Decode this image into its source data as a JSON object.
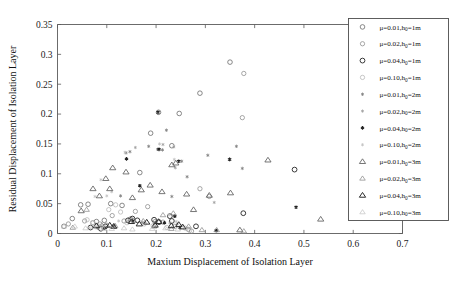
{
  "chart_data": {
    "type": "scatter",
    "title": "",
    "xlabel": "Maxium Displacement of Isolation Layer",
    "ylabel": "Residual Displacement of Isolation Layer",
    "xlim": [
      0,
      0.7
    ],
    "ylim": [
      0,
      0.35
    ],
    "xticks": [
      "0",
      "0.1",
      "0.2",
      "0.3",
      "0.4",
      "0.5",
      "0.6",
      "0.7"
    ],
    "xtick_values": [
      0,
      0.1,
      0.2,
      0.3,
      0.4,
      0.5,
      0.6,
      0.7
    ],
    "yticks": [
      "0",
      "0.05",
      "0.1",
      "0.15",
      "0.2",
      "0.25",
      "0.3",
      "0.35"
    ],
    "ytick_values": [
      0,
      0.05,
      0.1,
      0.15,
      0.2,
      0.25,
      0.3,
      0.35
    ],
    "grid": false,
    "legend_position": "right",
    "series": [
      {
        "name": "mu=0.01,h0=1m",
        "label_mu": "μ=0.01,h",
        "label_sub": "0",
        "label_tail": "=1m",
        "marker": "circle",
        "color": "#6b6b6b",
        "size": 4.6,
        "stroke_width": 0.8,
        "points": [
          [
            0.013,
            0.012
          ],
          [
            0.03,
            0.025
          ],
          [
            0.047,
            0.048
          ],
          [
            0.062,
            0.049
          ],
          [
            0.079,
            0.02
          ],
          [
            0.095,
            0.022
          ],
          [
            0.108,
            0.05
          ],
          [
            0.131,
            0.047
          ],
          [
            0.148,
            0.024
          ],
          [
            0.167,
            0.102
          ],
          [
            0.189,
            0.168
          ],
          [
            0.205,
            0.203
          ],
          [
            0.232,
            0.147
          ],
          [
            0.247,
            0.201
          ],
          [
            0.289,
            0.235
          ],
          [
            0.35,
            0.287
          ]
        ]
      },
      {
        "name": "mu=0.02,h0=1m",
        "label_mu": "μ=0.02,h",
        "label_sub": "0",
        "label_tail": "=1m",
        "marker": "circle",
        "color": "#8a8a8a",
        "size": 4.3,
        "stroke_width": 0.75,
        "points": [
          [
            0.022,
            0.016
          ],
          [
            0.055,
            0.021
          ],
          [
            0.072,
            0.018
          ],
          [
            0.086,
            0.016
          ],
          [
            0.111,
            0.03
          ],
          [
            0.135,
            0.021
          ],
          [
            0.158,
            0.037
          ],
          [
            0.183,
            0.045
          ],
          [
            0.198,
            0.02
          ],
          [
            0.214,
            0.019
          ],
          [
            0.238,
            0.012
          ],
          [
            0.265,
            0.007
          ],
          [
            0.272,
            0.004
          ],
          [
            0.289,
            0.075
          ],
          [
            0.308,
            0.062
          ],
          [
            0.375,
            0.194
          ],
          [
            0.378,
            0.268
          ]
        ]
      },
      {
        "name": "mu=0.04,h0=1m",
        "label_mu": "μ=0.04,h",
        "label_sub": "0",
        "label_tail": "=1m",
        "marker": "circle",
        "color": "#3a3a3a",
        "size": 4.8,
        "stroke_width": 1.0,
        "points": [
          [
            0.067,
            0.01
          ],
          [
            0.088,
            0.008
          ],
          [
            0.097,
            0.012
          ],
          [
            0.143,
            0.022
          ],
          [
            0.152,
            0.025
          ],
          [
            0.162,
            0.022
          ],
          [
            0.196,
            0.023
          ],
          [
            0.206,
            0.019
          ],
          [
            0.228,
            0.029
          ],
          [
            0.232,
            0.021
          ],
          [
            0.281,
            0.012
          ],
          [
            0.377,
            0.034
          ],
          [
            0.481,
            0.107
          ]
        ]
      },
      {
        "name": "mu=0.10,h0=1m",
        "label_mu": "μ=0.10,h",
        "label_sub": "0",
        "label_tail": "=1m",
        "marker": "circle",
        "color": "#b4b4b4",
        "size": 4.3,
        "stroke_width": 0.75,
        "points": [
          [
            0.06,
            0.023
          ],
          [
            0.071,
            0.018
          ],
          [
            0.084,
            0.012
          ],
          [
            0.104,
            0.04
          ],
          [
            0.118,
            0.048
          ],
          [
            0.128,
            0.036
          ],
          [
            0.141,
            0.018
          ],
          [
            0.176,
            0.016
          ],
          [
            0.194,
            0.013
          ],
          [
            0.222,
            0.01
          ],
          [
            0.259,
            0.009
          ],
          [
            0.268,
            0.005
          ]
        ]
      },
      {
        "name": "mu=0.01,h0=2m",
        "label_mu": "μ=0.01,h",
        "label_sub": "0",
        "label_tail": "=2m",
        "marker": "asterisk",
        "color": "#7a7a7a",
        "size": 3.4,
        "stroke_width": 0.75,
        "points": [
          [
            0.081,
            0.009
          ],
          [
            0.128,
            0.063
          ],
          [
            0.139,
            0.135
          ],
          [
            0.147,
            0.137
          ],
          [
            0.185,
            0.146
          ],
          [
            0.203,
            0.141
          ],
          [
            0.213,
            0.14
          ],
          [
            0.221,
            0.173
          ],
          [
            0.232,
            0.062
          ],
          [
            0.252,
            0.121
          ],
          [
            0.263,
            0.095
          ],
          [
            0.305,
            0.131
          ],
          [
            0.35,
            0.124
          ],
          [
            0.363,
            0.146
          ],
          [
            0.375,
            0.109
          ]
        ]
      },
      {
        "name": "mu=0.02,h0=2m",
        "label_mu": "μ=0.02,h",
        "label_sub": "0",
        "label_tail": "=2m",
        "marker": "asterisk",
        "color": "#9a9a9a",
        "size": 3.2,
        "stroke_width": 0.7,
        "points": [
          [
            0.077,
            0.01
          ],
          [
            0.091,
            0.009
          ],
          [
            0.116,
            0.014
          ],
          [
            0.144,
            0.02
          ],
          [
            0.158,
            0.144
          ],
          [
            0.172,
            0.019
          ],
          [
            0.196,
            0.017
          ],
          [
            0.214,
            0.149
          ],
          [
            0.228,
            0.018
          ],
          [
            0.236,
            0.145
          ],
          [
            0.239,
            0.11
          ],
          [
            0.243,
            0.016
          ],
          [
            0.318,
            0.052
          ],
          [
            0.323,
            0.004
          ]
        ]
      },
      {
        "name": "mu=0.04,h0=2m",
        "label_mu": "μ=0.04,h",
        "label_sub": "0",
        "label_tail": "=2m",
        "marker": "asterisk",
        "color": "#222222",
        "size": 3.7,
        "stroke_width": 1.05,
        "points": [
          [
            0.096,
            0.009
          ],
          [
            0.113,
            0.012
          ],
          [
            0.14,
            0.125
          ],
          [
            0.152,
            0.021
          ],
          [
            0.167,
            0.08
          ],
          [
            0.204,
            0.203
          ],
          [
            0.206,
            0.141
          ],
          [
            0.217,
            0.018
          ],
          [
            0.238,
            0.029
          ],
          [
            0.246,
            0.121
          ],
          [
            0.248,
            0.01
          ],
          [
            0.322,
            0.005
          ],
          [
            0.349,
            0.124
          ],
          [
            0.484,
            0.044
          ]
        ]
      },
      {
        "name": "mu=0.10,h0=2m",
        "label_mu": "μ=0.10,h",
        "label_sub": "0",
        "label_tail": "=2m",
        "marker": "asterisk",
        "color": "#bdbdbd",
        "size": 3.2,
        "stroke_width": 0.7,
        "points": [
          [
            0.064,
            0.01
          ],
          [
            0.076,
            0.062
          ],
          [
            0.088,
            0.09
          ],
          [
            0.1,
            0.063
          ],
          [
            0.11,
            0.07
          ],
          [
            0.124,
            0.021
          ],
          [
            0.137,
            0.136
          ],
          [
            0.148,
            0.022
          ],
          [
            0.207,
            0.15
          ],
          [
            0.226,
            0.031
          ],
          [
            0.237,
            0.124
          ],
          [
            0.241,
            0.02
          ],
          [
            0.252,
            0.013
          ]
        ]
      },
      {
        "name": "mu=0.01,h0=3m",
        "label_mu": "μ=0.01,h",
        "label_sub": "0",
        "label_tail": "=3m",
        "marker": "triangle",
        "color": "#5e5e5e",
        "size": 5.0,
        "stroke_width": 0.85,
        "points": [
          [
            0.048,
            0.038
          ],
          [
            0.072,
            0.075
          ],
          [
            0.085,
            0.063
          ],
          [
            0.098,
            0.092
          ],
          [
            0.106,
            0.075
          ],
          [
            0.112,
            0.11
          ],
          [
            0.139,
            0.103
          ],
          [
            0.152,
            0.06
          ],
          [
            0.17,
            0.073
          ],
          [
            0.188,
            0.081
          ],
          [
            0.212,
            0.07
          ],
          [
            0.232,
            0.115
          ],
          [
            0.24,
            0.118
          ],
          [
            0.262,
            0.066
          ],
          [
            0.276,
            0.04
          ],
          [
            0.308,
            0.064
          ],
          [
            0.351,
            0.068
          ],
          [
            0.37,
            0.006
          ],
          [
            0.427,
            0.123
          ],
          [
            0.534,
            0.024
          ]
        ]
      },
      {
        "name": "mu=0.02,h0=3m",
        "label_mu": "μ=0.02,h",
        "label_sub": "0",
        "label_tail": "=3m",
        "marker": "triangle",
        "color": "#8c8c8c",
        "size": 4.5,
        "stroke_width": 0.75,
        "points": [
          [
            0.031,
            0.01
          ],
          [
            0.059,
            0.04
          ],
          [
            0.09,
            0.014
          ],
          [
            0.1,
            0.014
          ],
          [
            0.117,
            0.013
          ],
          [
            0.155,
            0.022
          ],
          [
            0.174,
            0.021
          ],
          [
            0.196,
            0.012
          ],
          [
            0.214,
            0.031
          ],
          [
            0.231,
            0.008
          ],
          [
            0.235,
            0.034
          ],
          [
            0.266,
            0.012
          ],
          [
            0.293,
            0.006
          ],
          [
            0.323,
            0.006
          ],
          [
            0.378,
            0.004
          ]
        ]
      },
      {
        "name": "mu=0.04,h0=3m",
        "label_mu": "μ=0.04,h",
        "label_sub": "0",
        "label_tail": "=3m",
        "marker": "triangle",
        "color": "#2e2e2e",
        "size": 5.1,
        "stroke_width": 1.0,
        "points": [
          [
            0.079,
            0.013
          ],
          [
            0.106,
            0.014
          ],
          [
            0.114,
            0.012
          ],
          [
            0.15,
            0.02
          ],
          [
            0.166,
            0.016
          ],
          [
            0.181,
            0.019
          ],
          [
            0.198,
            0.014
          ],
          [
            0.205,
            0.02
          ],
          [
            0.231,
            0.013
          ],
          [
            0.246,
            0.015
          ],
          [
            0.254,
            0.011
          ]
        ]
      },
      {
        "name": "mu=0.10,h0=3m",
        "label_mu": "μ=0.10,h",
        "label_sub": "0",
        "label_tail": "=3m",
        "marker": "triangle",
        "color": "#c2c2c2",
        "size": 4.4,
        "stroke_width": 0.7,
        "points": [
          [
            0.013,
            0.012
          ],
          [
            0.035,
            0.012
          ],
          [
            0.057,
            0.009
          ],
          [
            0.072,
            0.011
          ],
          [
            0.093,
            0.008
          ],
          [
            0.11,
            0.008
          ],
          [
            0.135,
            0.009
          ],
          [
            0.152,
            0.007
          ],
          [
            0.192,
            0.008
          ],
          [
            0.219,
            0.009
          ],
          [
            0.244,
            0.007
          ]
        ]
      }
    ]
  }
}
